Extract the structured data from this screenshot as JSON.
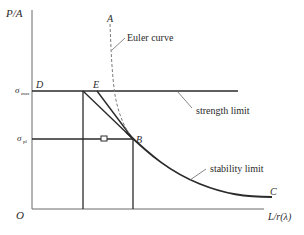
{
  "diagram": {
    "type": "column-buckling-limit-diagram",
    "axes": {
      "y_label": "P/A",
      "x_label": "L/r(λ)",
      "origin_label": "O"
    },
    "y_ticks": [
      {
        "name": "sigma-max",
        "symbol": "σ",
        "subscript": "max"
      },
      {
        "name": "sigma-pl",
        "symbol": "σ",
        "subscript": "pl"
      }
    ],
    "points": {
      "A": "A",
      "B": "B",
      "C": "C",
      "D": "D",
      "E": "E"
    },
    "annotations": {
      "euler": "Euler curve",
      "strength": "strength limit",
      "stability": "stability limit"
    },
    "colors": {
      "line": "#2a2a2a",
      "axis": "#6a6a6a",
      "dashed": "#7a7a7a"
    }
  }
}
